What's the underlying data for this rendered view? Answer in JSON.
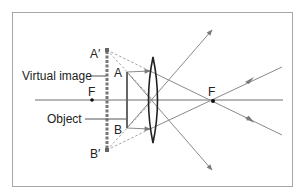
{
  "diagram": {
    "labels": {
      "image_top": "A′",
      "image_bottom": "B′",
      "object_top": "A",
      "object_bottom": "B",
      "focal_left": "F",
      "focal_right": "F",
      "virtual_image": "Virtual image",
      "object": "Object"
    },
    "colors": {
      "frame": "#a8a8a8",
      "ray": "#8a8a8a",
      "axis": "#6e6e6e",
      "lens": "#222222",
      "text": "#222222",
      "image": "#777777"
    }
  }
}
